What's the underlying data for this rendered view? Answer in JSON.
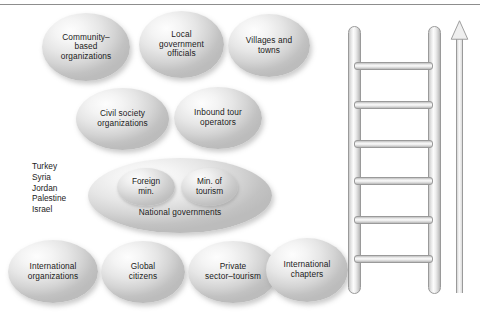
{
  "diagram": {
    "title_rule": true,
    "rows": [
      {
        "id": "row-1",
        "bubbles": [
          {
            "name": "community-based-organizations",
            "label": "Community–\nbased\norganizations",
            "x": 42,
            "y": 13,
            "w": 88,
            "h": 68,
            "font": 8.3
          },
          {
            "name": "local-government-officials",
            "label": "Local\ngovernment\nofficials",
            "x": 139,
            "y": 11,
            "w": 85,
            "h": 67,
            "font": 8.3
          },
          {
            "name": "villages-and-towns",
            "label": "Villages and\ntowns",
            "x": 228,
            "y": 14,
            "w": 82,
            "h": 63,
            "font": 8.3
          }
        ]
      },
      {
        "id": "row-2",
        "bubbles": [
          {
            "name": "civil-society-organizations",
            "label": "Civil  society\norganizations",
            "x": 76,
            "y": 88,
            "w": 93,
            "h": 62,
            "font": 8.3
          },
          {
            "name": "inbound-tour-operators",
            "label": "Inbound tour\noperators",
            "x": 174,
            "y": 87,
            "w": 88,
            "h": 62,
            "font": 8.3
          }
        ]
      },
      {
        "id": "row-4",
        "bubbles": [
          {
            "name": "international-organizations",
            "label": "International\norganizations",
            "x": 8,
            "y": 240,
            "w": 90,
            "h": 63,
            "font": 8.3
          },
          {
            "name": "global-citizens",
            "label": "Global\ncitizens",
            "x": 101,
            "y": 241,
            "w": 84,
            "h": 62,
            "font": 8.3
          },
          {
            "name": "private-sector-tourism",
            "label": "Private\nsector–tourism",
            "x": 188,
            "y": 241,
            "w": 90,
            "h": 62,
            "font": 8.3
          },
          {
            "name": "international-chapters",
            "label": "International\nchapters",
            "x": 266,
            "y": 238,
            "w": 82,
            "h": 64,
            "font": 8.3
          }
        ]
      }
    ],
    "national_governments": {
      "name": "national-governments",
      "label": "National  governments",
      "x": 88,
      "y": 158,
      "w": 184,
      "h": 75,
      "font": 8.3,
      "label_top": 202,
      "inner": [
        {
          "name": "foreign-ministry",
          "label": "Foreign\nmin.",
          "x": 117,
          "y": 168,
          "w": 58,
          "h": 38,
          "font": 8.3
        },
        {
          "name": "ministry-of-tourism",
          "label": "Min. of\ntourism",
          "x": 181,
          "y": 168,
          "w": 57,
          "h": 38,
          "font": 8.3
        }
      ]
    },
    "country_list": {
      "name": "country-list",
      "label": "Turkey\nSyria\nJordan\nPalestine\nIsrael",
      "x": 32,
      "y": 161,
      "font": 8.3,
      "countries": [
        "Turkey",
        "Syria",
        "Jordan",
        "Palestine",
        "Israel"
      ]
    },
    "ladder": {
      "name": "ladder",
      "rails": 2,
      "rung_count": 6,
      "rung_tops": [
        62,
        101,
        140,
        177,
        216,
        255
      ],
      "arrow": {
        "name": "up-arrow",
        "direction": "up"
      }
    },
    "colors": {
      "bubble_light": "#fdfdfd",
      "bubble_dark": "#bcbcbc",
      "text": "#1b1b1b",
      "rule": "#8d8d8d",
      "metal_outline": "#9a9a9a"
    }
  }
}
